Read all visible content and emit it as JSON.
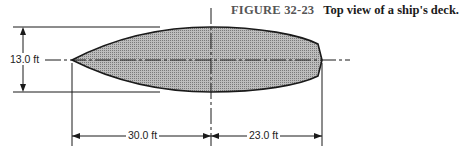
{
  "figure": {
    "number": "FIGURE 32-23",
    "title": "Top view of a ship's deck."
  },
  "dimensions": {
    "width": "13.0 ft",
    "bow_length": "30.0 ft",
    "stern_length": "23.0 ft"
  },
  "colors": {
    "fill": "#9a9a9a",
    "stroke": "#1a1a1a"
  }
}
